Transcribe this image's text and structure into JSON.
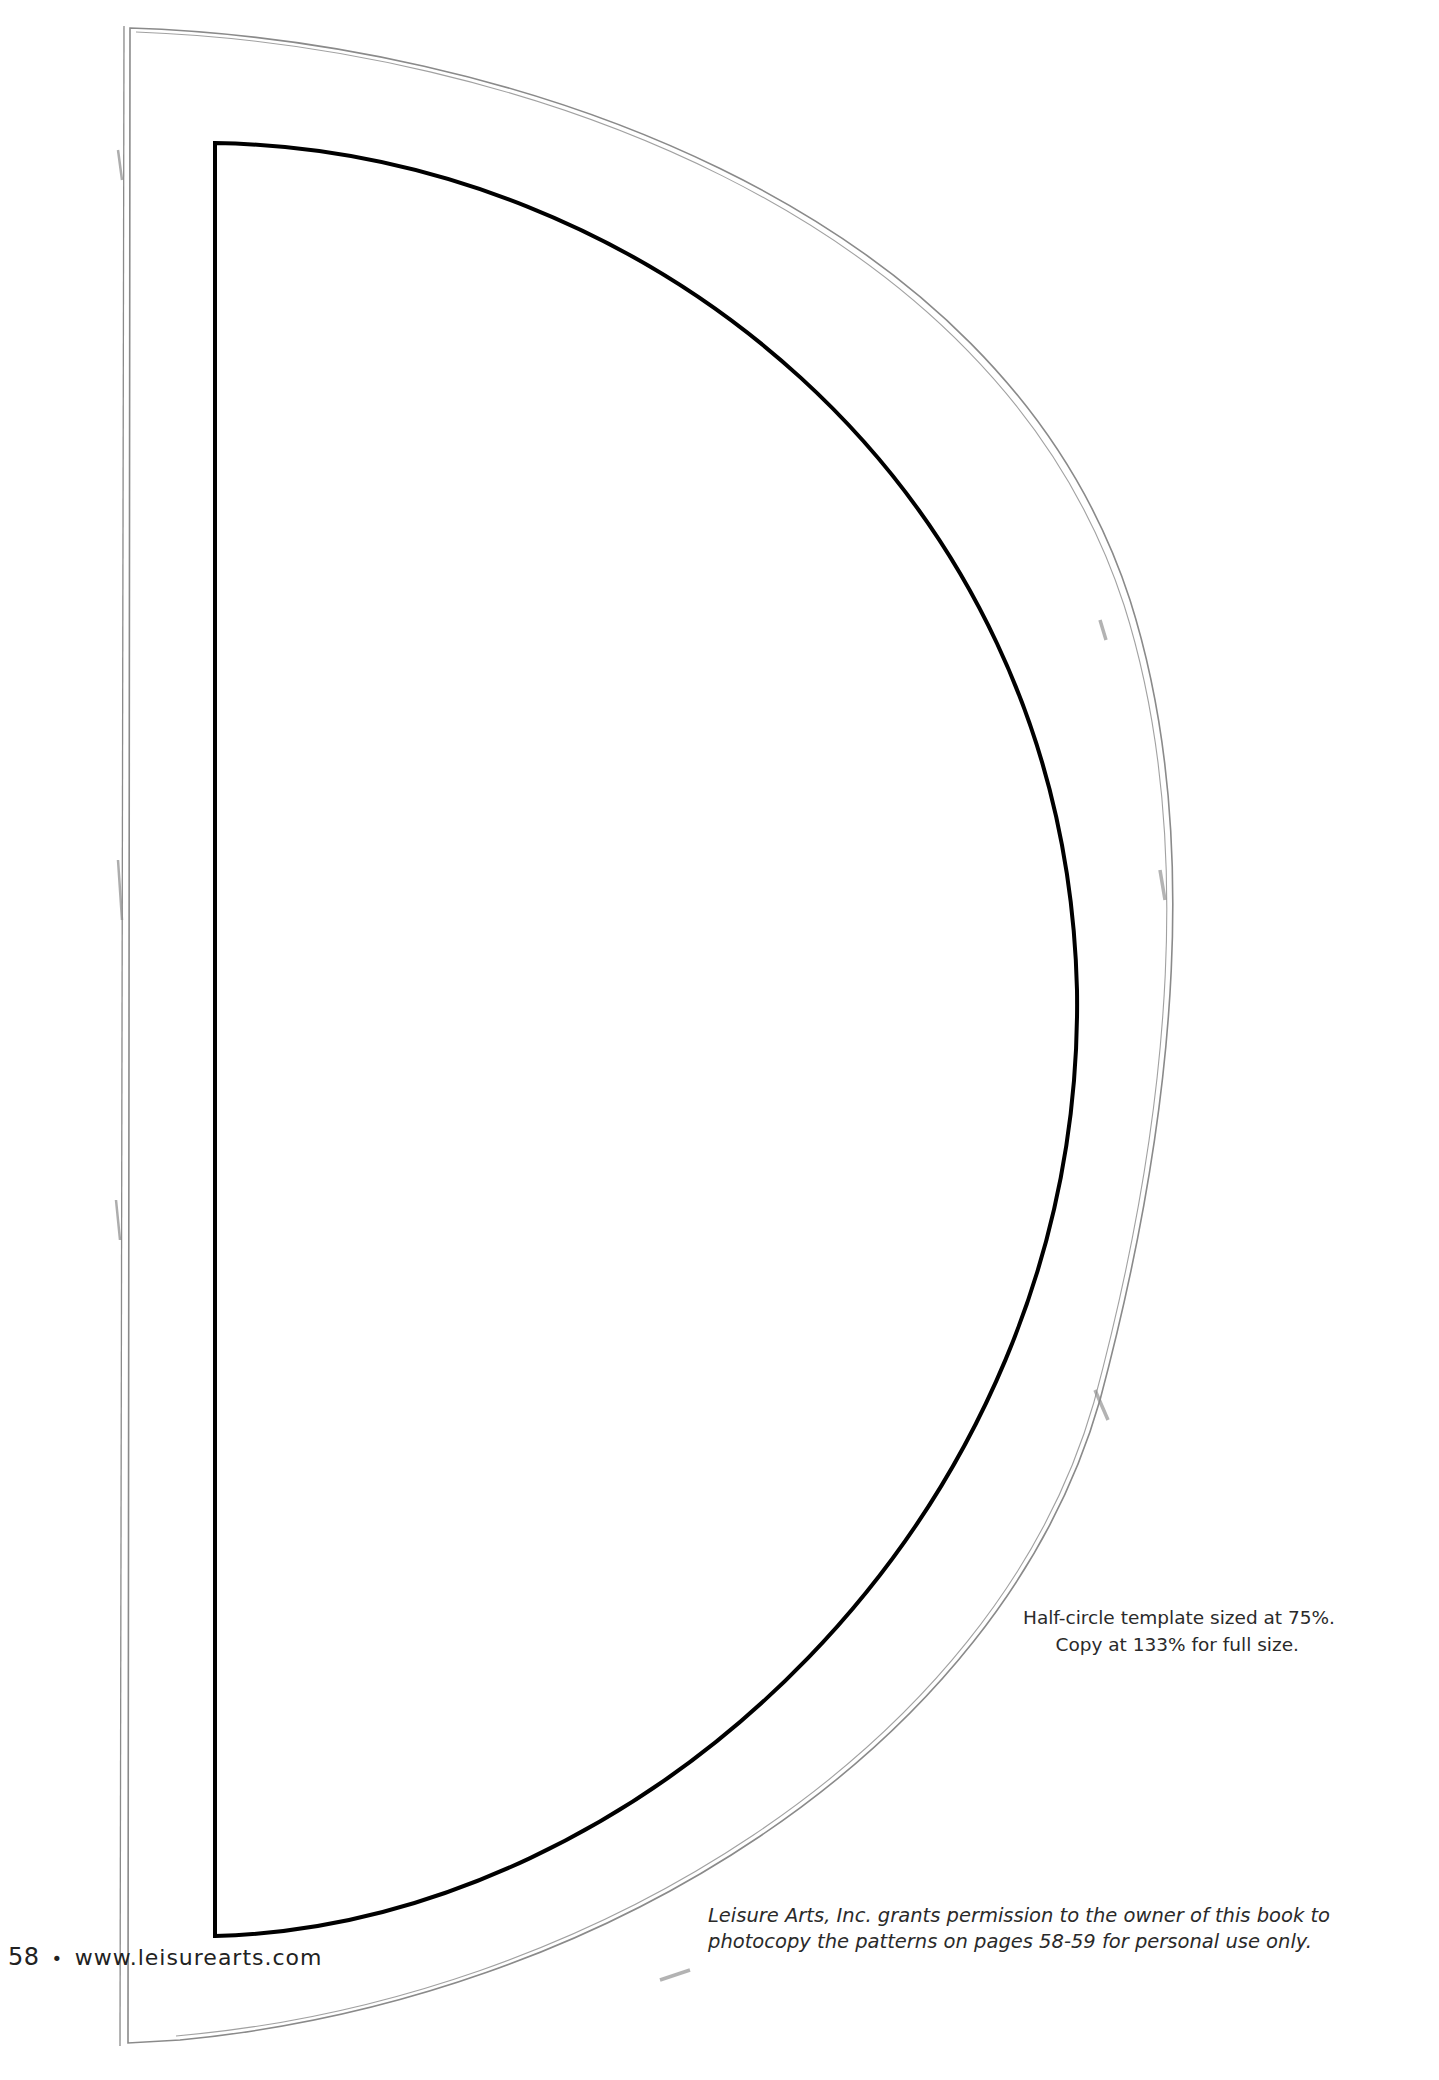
{
  "page": {
    "page_number": "58",
    "separator": "•",
    "website": "www.leisurearts.com"
  },
  "template": {
    "shape": "half-circle",
    "size_note_line1": "Half-circle template sized at 75%.",
    "size_note_line2": "Copy at 133% for full size."
  },
  "permission": {
    "line1": "Leisure Arts, Inc. grants permission to the owner of this book to",
    "line2": "photocopy the patterns on pages 58-59 for personal use only."
  },
  "colors": {
    "inner_outline": "#000000",
    "sketch_outline": "#8a8a8a",
    "text": "#2a2a2a"
  }
}
